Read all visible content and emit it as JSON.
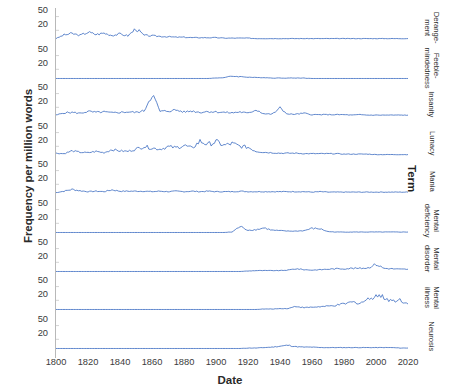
{
  "chart_data": {
    "type": "line",
    "title": "",
    "xlabel": "Date",
    "ylabel": "Frequency per million words",
    "xlim": [
      1800,
      2020
    ],
    "ylim": [
      0,
      60
    ],
    "grid": false,
    "legend_position": "right",
    "legend_title": "Term",
    "x_ticks": [
      1800,
      1820,
      1840,
      1860,
      1880,
      1900,
      1920,
      1940,
      1960,
      1980,
      2000,
      2020
    ],
    "y_ticks": [
      20,
      50
    ],
    "facet": true,
    "facet_layout": "vertical-stack",
    "line_color": "#4472C4",
    "x": [
      1800,
      1805,
      1810,
      1815,
      1820,
      1825,
      1830,
      1835,
      1840,
      1845,
      1850,
      1855,
      1860,
      1865,
      1870,
      1875,
      1880,
      1885,
      1890,
      1895,
      1900,
      1905,
      1910,
      1915,
      1920,
      1925,
      1930,
      1935,
      1940,
      1945,
      1950,
      1955,
      1960,
      1965,
      1970,
      1975,
      1980,
      1985,
      1990,
      1995,
      2000,
      2005,
      2010,
      2015,
      2020
    ],
    "series": [
      {
        "name": "Derangement",
        "label_lines": [
          "Derange-",
          "ment"
        ],
        "values": [
          2,
          10,
          13,
          9,
          16,
          11,
          14,
          9,
          12,
          8,
          24,
          9,
          8,
          7,
          6,
          5,
          5,
          4,
          4,
          4,
          4,
          3,
          3,
          3,
          3,
          2,
          2,
          2,
          2,
          2,
          2,
          2,
          2,
          2,
          2,
          2,
          2,
          2,
          2,
          2,
          2,
          2,
          2,
          2,
          2
        ]
      },
      {
        "name": "Feeble-mindedness",
        "label_lines": [
          "Feeble-",
          "mindedness"
        ],
        "values": [
          0,
          0,
          0,
          0,
          0,
          0,
          0,
          0,
          0,
          0,
          0,
          0,
          0,
          0,
          0,
          0,
          0,
          0,
          0,
          0,
          1,
          2,
          5,
          4,
          3,
          2,
          2,
          1,
          1,
          1,
          1,
          1,
          0,
          0,
          0,
          0,
          0,
          0,
          0,
          0,
          0,
          0,
          0,
          0,
          0
        ]
      },
      {
        "name": "Insanity",
        "label_lines": [
          "Insanity"
        ],
        "values": [
          3,
          8,
          9,
          7,
          11,
          9,
          10,
          8,
          9,
          10,
          9,
          12,
          50,
          11,
          12,
          14,
          10,
          12,
          9,
          11,
          10,
          9,
          8,
          10,
          7,
          15,
          6,
          5,
          18,
          5,
          5,
          7,
          4,
          4,
          4,
          4,
          4,
          3,
          4,
          3,
          3,
          3,
          3,
          3,
          3
        ]
      },
      {
        "name": "Lunacy",
        "label_lines": [
          "Lunacy"
        ],
        "values": [
          5,
          4,
          10,
          7,
          6,
          9,
          6,
          13,
          10,
          9,
          14,
          20,
          16,
          14,
          19,
          17,
          22,
          16,
          31,
          24,
          30,
          22,
          26,
          20,
          18,
          9,
          7,
          6,
          5,
          5,
          5,
          4,
          4,
          4,
          4,
          4,
          3,
          3,
          3,
          3,
          2,
          2,
          2,
          2,
          2
        ]
      },
      {
        "name": "Mania",
        "label_lines": [
          "Mania"
        ],
        "values": [
          2,
          5,
          9,
          6,
          4,
          5,
          4,
          8,
          5,
          5,
          5,
          5,
          4,
          5,
          4,
          5,
          4,
          5,
          4,
          5,
          4,
          4,
          4,
          5,
          4,
          4,
          4,
          4,
          4,
          4,
          4,
          4,
          3,
          4,
          3,
          3,
          3,
          3,
          3,
          3,
          3,
          3,
          3,
          3,
          3
        ]
      },
      {
        "name": "Mental deficiency",
        "label_lines": [
          "Mental",
          "deficiency"
        ],
        "values": [
          0,
          0,
          0,
          0,
          0,
          0,
          0,
          0,
          0,
          0,
          0,
          0,
          0,
          0,
          0,
          0,
          0,
          0,
          0,
          0,
          0,
          0,
          1,
          13,
          5,
          6,
          10,
          5,
          4,
          3,
          3,
          4,
          9,
          8,
          2,
          1,
          1,
          1,
          1,
          1,
          1,
          1,
          1,
          1,
          1
        ]
      },
      {
        "name": "Mental disorder",
        "label_lines": [
          "Mental",
          "disorder"
        ],
        "values": [
          0,
          0,
          0,
          0,
          0,
          0,
          0,
          0,
          0,
          0,
          0,
          0,
          0,
          0,
          0,
          0,
          0,
          0,
          0,
          0,
          0,
          0,
          0,
          0,
          1,
          2,
          2,
          2,
          2,
          3,
          6,
          4,
          3,
          4,
          5,
          6,
          6,
          7,
          7,
          8,
          16,
          7,
          6,
          5,
          5
        ]
      },
      {
        "name": "Mental illness",
        "label_lines": [
          "Mental",
          "illness"
        ],
        "values": [
          0,
          0,
          0,
          0,
          0,
          0,
          0,
          0,
          0,
          0,
          0,
          0,
          0,
          0,
          0,
          0,
          0,
          0,
          0,
          0,
          0,
          0,
          0,
          0,
          0,
          0,
          1,
          1,
          2,
          2,
          7,
          4,
          5,
          6,
          7,
          9,
          12,
          16,
          14,
          22,
          32,
          26,
          19,
          21,
          12
        ]
      },
      {
        "name": "Neurosis",
        "label_lines": [
          "Neurosis"
        ],
        "values": [
          0,
          0,
          0,
          0,
          0,
          0,
          0,
          0,
          0,
          0,
          0,
          0,
          0,
          0,
          0,
          0,
          0,
          0,
          0,
          0,
          0,
          0,
          0,
          0,
          1,
          1,
          2,
          3,
          5,
          7,
          4,
          3,
          3,
          2,
          2,
          2,
          2,
          2,
          2,
          2,
          2,
          2,
          2,
          1,
          1
        ]
      }
    ]
  },
  "axes": {
    "x_title": "Date",
    "y_title": "Frequency per million words",
    "x_tick_labels": [
      "1800",
      "1820",
      "1840",
      "1860",
      "1880",
      "1900",
      "1920",
      "1940",
      "1960",
      "1980",
      "2000",
      "2020"
    ],
    "y_tick_labels": [
      "50",
      "20"
    ]
  },
  "legend": {
    "title": "Term"
  }
}
